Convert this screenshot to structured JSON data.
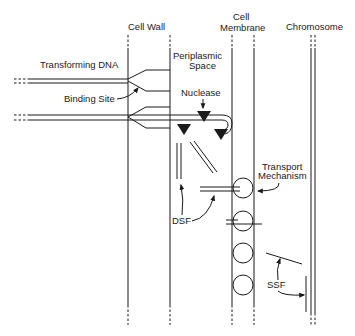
{
  "diagram": {
    "colors": {
      "ink": "#1a1a1a",
      "background": "#ffffff"
    },
    "regions": {
      "cell_wall": "Cell Wall",
      "cell_membrane_line1": "Cell",
      "cell_membrane_line2": "Membrane",
      "chromosome": "Chromosome",
      "periplasmic_line1": "Periplasmic",
      "periplasmic_line2": "Space"
    },
    "labels": {
      "transforming_dna": "Transforming DNA",
      "binding_site": "Binding Site",
      "nuclease": "Nuclease",
      "transport_line1": "Transport",
      "transport_line2": "Mechanism",
      "dsf": "DSF",
      "ssf": "SSF"
    },
    "transport_channels": 4
  }
}
